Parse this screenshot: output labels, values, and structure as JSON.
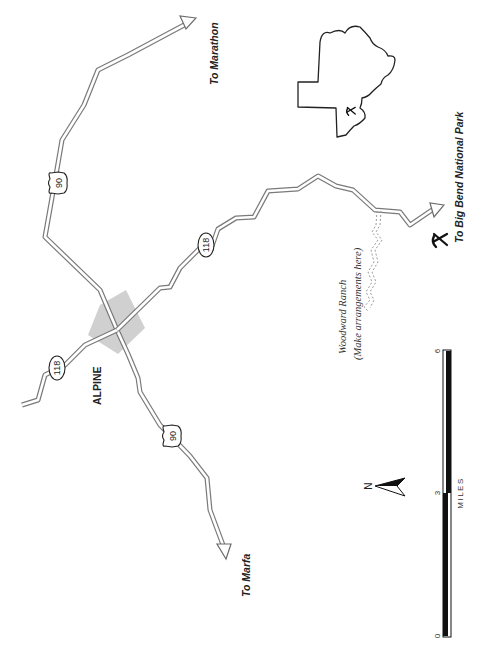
{
  "map": {
    "orientation": "rotated 90 degrees counter-clockwise (labels read bottom-to-top)",
    "town": {
      "label": "ALPINE"
    },
    "highways": [
      {
        "id": "us90-north",
        "shield": "90",
        "shield_type": "us-highway"
      },
      {
        "id": "us90-south",
        "shield": "90",
        "shield_type": "us-highway"
      },
      {
        "id": "sh118-west",
        "shield": "118",
        "shield_type": "state-highway"
      },
      {
        "id": "sh118-east",
        "shield": "118",
        "shield_type": "state-highway"
      }
    ],
    "destinations": {
      "marathon": "To Marathon",
      "marfa": "To Marfa",
      "big_bend": "To Big Bend National Park"
    },
    "ranch": {
      "name": "Woodward Ranch",
      "note": "(Make arrangements here)"
    },
    "scale_bar": {
      "ticks": [
        "0",
        "3",
        "6"
      ],
      "unit": "MILES"
    },
    "north_arrow": {
      "label": "N"
    },
    "inset": {
      "description": "Outline of Brewster County with rock-hammer symbol marking site",
      "symbol": "rock-hammer-icon"
    },
    "site_symbol": "rock-hammer-icon",
    "colors": {
      "road_outline": "#7a7a7a",
      "town_shading": "#c8c8c8",
      "ink": "#222222",
      "background": "#ffffff"
    }
  }
}
